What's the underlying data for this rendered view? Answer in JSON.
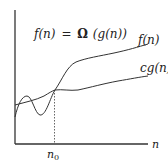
{
  "diagram": {
    "formula": {
      "lhs": "f(n)",
      "eq": "=",
      "omega": "Ω",
      "rhs": "(g(n))"
    },
    "curves": [
      {
        "name": "f(n)",
        "label": "f(n)"
      },
      {
        "name": "cg(n)",
        "label": "cg(n)"
      }
    ],
    "axes": {
      "x_label": "n",
      "y_label": ""
    },
    "marker": {
      "label_base": "n",
      "label_sub": "0"
    },
    "colors": {
      "stroke": "#333333",
      "background": "#ffffff"
    }
  }
}
